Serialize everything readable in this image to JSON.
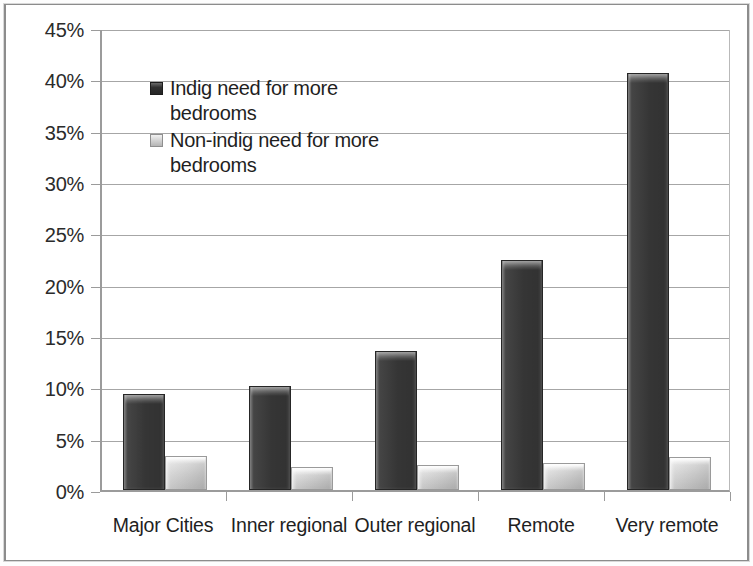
{
  "chart_data": {
    "type": "bar",
    "title": "",
    "xlabel": "",
    "ylabel": "",
    "ylim": [
      0,
      45
    ],
    "grid": true,
    "legend_position": "inside-top-left",
    "categories": [
      "Major Cities",
      "Inner regional",
      "Outer regional",
      "Remote",
      "Very remote"
    ],
    "y_ticks": [
      "0%",
      "5%",
      "10%",
      "15%",
      "20%",
      "25%",
      "30%",
      "35%",
      "40%",
      "45%"
    ],
    "y_tick_values": [
      0,
      5,
      10,
      15,
      20,
      25,
      30,
      35,
      40,
      45
    ],
    "series": [
      {
        "name": "Indig need for more bedrooms",
        "legend_label": "Indig need for more\nbedrooms",
        "color": "#3b3b3b",
        "values": [
          9.4,
          10.1,
          13.5,
          22.4,
          40.6
        ]
      },
      {
        "name": "Non-indig need for more bedrooms",
        "legend_label": "Non-indig need for more\nbedrooms",
        "color": "#cfcfcf",
        "values": [
          3.3,
          2.2,
          2.4,
          2.6,
          3.2
        ]
      }
    ]
  },
  "colors": {
    "series_dark": "#3b3b3b",
    "series_light": "#cfcfcf",
    "gridline": "#a6a6a6",
    "axis": "#9b9b9b",
    "text": "#1f1f1f",
    "frame": "#8c8c8c",
    "background": "#ffffff"
  }
}
